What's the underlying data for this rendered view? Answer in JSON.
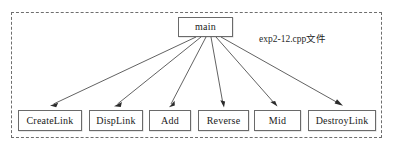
{
  "diagram": {
    "scope_caption": "exp2-12.cpp文件",
    "root_node": {
      "id": "main",
      "label": "main"
    },
    "child_nodes": [
      {
        "id": "createlink",
        "label": "CreateLink"
      },
      {
        "id": "displink",
        "label": "DispLink"
      },
      {
        "id": "add",
        "label": "Add"
      },
      {
        "id": "reverse",
        "label": "Reverse"
      },
      {
        "id": "mid",
        "label": "Mid"
      },
      {
        "id": "destroylink",
        "label": "DestroyLink"
      }
    ],
    "edges": [
      {
        "from": "main",
        "to": "createlink",
        "style": "arrow"
      },
      {
        "from": "main",
        "to": "displink",
        "style": "arrow"
      },
      {
        "from": "main",
        "to": "add",
        "style": "arrow"
      },
      {
        "from": "main",
        "to": "reverse",
        "style": "arrow"
      },
      {
        "from": "main",
        "to": "mid",
        "style": "arrow"
      },
      {
        "from": "main",
        "to": "destroylink",
        "style": "arrow"
      }
    ],
    "bottom_caption": "",
    "colors": {
      "box_border": "#6a6a6a",
      "box_fill": "#ffffff",
      "scope_border": "#6e6e6e",
      "edge": "#3a3a3a",
      "text": "#1a1a1a",
      "background": "#ffffff"
    }
  }
}
